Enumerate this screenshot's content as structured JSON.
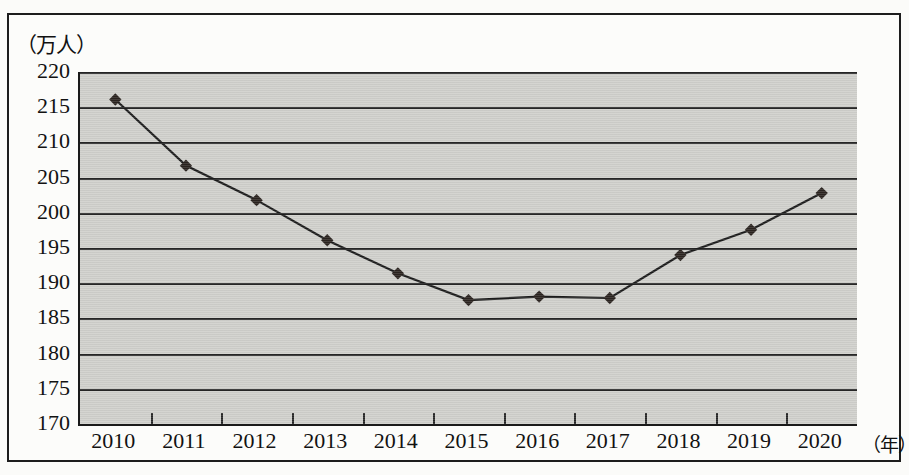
{
  "chart_data": {
    "type": "line",
    "title": "",
    "subtitle": "",
    "xlabel": "（年）",
    "ylabel": "（万人）",
    "categories": [
      "2010",
      "2011",
      "2012",
      "2013",
      "2014",
      "2015",
      "2016",
      "2017",
      "2018",
      "2019",
      "2020"
    ],
    "values": [
      216.1,
      206.7,
      201.8,
      196.1,
      191.4,
      187.6,
      188.1,
      187.9,
      194.0,
      197.6,
      202.8
    ],
    "series": [
      {
        "name": "人数",
        "values": [
          216.1,
          206.7,
          201.8,
          196.1,
          191.4,
          187.6,
          188.1,
          187.9,
          194.0,
          197.6,
          202.8
        ]
      }
    ],
    "ylim": [
      170,
      220
    ],
    "yticks": [
      170,
      175,
      180,
      185,
      190,
      195,
      200,
      205,
      210,
      215,
      220
    ],
    "ytick_labels": [
      "170",
      "175",
      "180",
      "185",
      "190",
      "195",
      "200",
      "205",
      "210",
      "215",
      "220"
    ],
    "xtick_labels": [
      "2010",
      "2011",
      "2012",
      "2013",
      "2014",
      "2015",
      "2016",
      "2017",
      "2018",
      "2019",
      "2020"
    ],
    "grid": "horizontal",
    "legend": "none",
    "marker": "diamond",
    "plot_background": "#cfcfcb",
    "line_color": "#1b1b1b",
    "marker_color": "#2a231f",
    "axis_color": "#262626"
  }
}
